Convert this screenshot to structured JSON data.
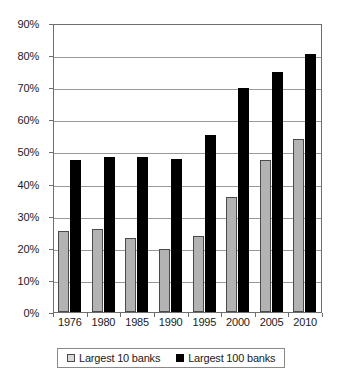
{
  "chart_data": {
    "type": "bar",
    "title": "",
    "subtitle": "",
    "xlabel": "",
    "ylabel": "",
    "categories": [
      "1976",
      "1980",
      "1985",
      "1990",
      "1995",
      "2000",
      "2005",
      "2010"
    ],
    "series": [
      {
        "name": "Largest 10 banks",
        "color": "#b3b3b3",
        "values": [
          25.3,
          26.0,
          23.0,
          19.5,
          23.6,
          35.7,
          47.3,
          53.9
        ]
      },
      {
        "name": "Largest 100 banks",
        "color": "#000000",
        "values": [
          47.4,
          48.2,
          48.4,
          47.8,
          55.0,
          69.8,
          74.8,
          80.3
        ]
      }
    ],
    "ylim": [
      0,
      90
    ],
    "ytick_values": [
      0,
      10,
      20,
      30,
      40,
      50,
      60,
      70,
      80,
      90
    ],
    "ytick_labels": [
      "0%",
      "10%",
      "20%",
      "30%",
      "40%",
      "50%",
      "60%",
      "70%",
      "80%",
      "90%"
    ],
    "grid": true,
    "grid_axis": "y",
    "legend_position": "bottom",
    "legend_entries": [
      "Largest 10 banks",
      "Largest 100 banks"
    ]
  }
}
